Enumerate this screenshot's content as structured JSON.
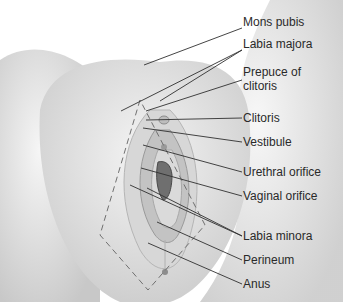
{
  "figure": {
    "labels": [
      {
        "text": "Mons pubis",
        "y": 22
      },
      {
        "text": "Labia majora",
        "y": 44
      },
      {
        "text": "Prepuce of",
        "y": 72
      },
      {
        "text": "clitoris",
        "y": 86
      },
      {
        "text": "Clitoris",
        "y": 112
      },
      {
        "text": "Vestibule",
        "y": 136
      },
      {
        "text": "Urethral orifice",
        "y": 166
      },
      {
        "text": "Vaginal orifice",
        "y": 190
      },
      {
        "text": "Labia minora",
        "y": 230
      },
      {
        "text": "Perineum",
        "y": 254
      },
      {
        "text": "Anus",
        "y": 278
      }
    ]
  }
}
